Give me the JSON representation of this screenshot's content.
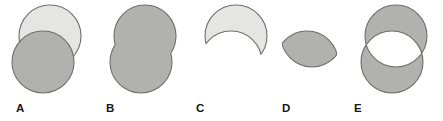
{
  "figure": {
    "width": 443,
    "height": 121,
    "background_color": "#ffffff",
    "stroke_color": "#6d6d6b",
    "stroke_width": 1.1,
    "fill_light": "#e5e5e3",
    "fill_medium": "#b1b1af",
    "fill_empty": "#ffffff",
    "label_color": "#151515"
  },
  "panels": [
    {
      "id": "panel-a",
      "label": "A",
      "operation": "both-circles-overlaid",
      "label_x": 16,
      "label_y": 102,
      "panel_x": 0,
      "panel_width": 100,
      "circles": [
        {
          "name": "upper-right-circle",
          "cx": 50,
          "cy": 36,
          "r": 31,
          "fill": "#e5e5e3"
        },
        {
          "name": "lower-left-circle",
          "cx": 43,
          "cy": 62,
          "r": 31,
          "fill": "#b1b1af"
        }
      ]
    },
    {
      "id": "panel-b",
      "label": "B",
      "operation": "union",
      "label_x": 106,
      "label_y": 102,
      "panel_x": 96,
      "panel_width": 100,
      "circles": [
        {
          "name": "upper-circle",
          "cx": 49,
          "cy": 36,
          "r": 31,
          "fill": "#b1b1af"
        },
        {
          "name": "lower-circle",
          "cx": 45,
          "cy": 62,
          "r": 31,
          "fill": "#b1b1af"
        }
      ]
    },
    {
      "id": "panel-c",
      "label": "C",
      "operation": "difference",
      "label_x": 196,
      "label_y": 102,
      "panel_x": 190,
      "panel_width": 100,
      "circles": [
        {
          "name": "kept-circle",
          "cx": 46,
          "cy": 36,
          "r": 31,
          "fill": "#e5e5e3"
        },
        {
          "name": "subtracted-circle",
          "cx": 41,
          "cy": 62,
          "r": 31,
          "fill": "none"
        }
      ]
    },
    {
      "id": "panel-d",
      "label": "D",
      "operation": "intersection",
      "label_x": 282,
      "label_y": 102,
      "panel_x": 276,
      "panel_width": 100,
      "circles": [
        {
          "name": "first-circle",
          "cx": 36,
          "cy": 36,
          "r": 31,
          "fill": "#b1b1af"
        },
        {
          "name": "second-circle",
          "cx": 31,
          "cy": 62,
          "r": 31,
          "fill": "#b1b1af"
        }
      ]
    },
    {
      "id": "panel-e",
      "label": "E",
      "operation": "symmetric-difference",
      "label_x": 354,
      "label_y": 102,
      "panel_x": 348,
      "panel_width": 95,
      "circles": [
        {
          "name": "upper-circle",
          "cx": 48,
          "cy": 36,
          "r": 31,
          "fill": "#b1b1af"
        },
        {
          "name": "lower-circle",
          "cx": 44,
          "cy": 62,
          "r": 31,
          "fill": "#b1b1af"
        }
      ]
    }
  ]
}
